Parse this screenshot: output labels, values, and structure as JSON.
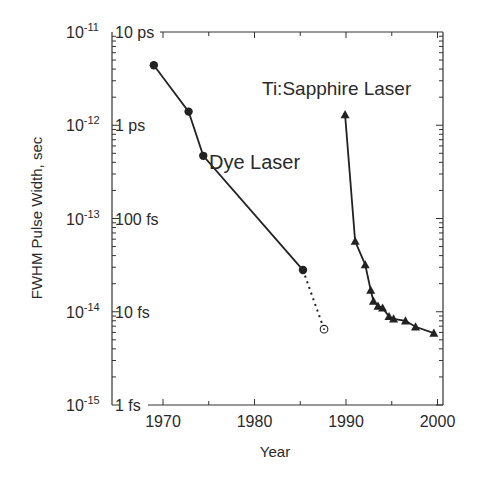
{
  "chart_data": {
    "type": "line",
    "title": "",
    "xlabel": "Year",
    "ylabel": "FWHM Pulse Width, sec",
    "xlim": [
      1965,
      2001
    ],
    "ylim": [
      1e-15,
      1e-11
    ],
    "yscale": "log",
    "x_ticks": [
      1970,
      1980,
      1990,
      2000
    ],
    "x_tick_labels": [
      "1970",
      "1980",
      "1990",
      "2000"
    ],
    "y_ticks": [
      {
        "value": 1e-11,
        "exp_label": "10",
        "exp": "-11",
        "inner_label": "10 ps"
      },
      {
        "value": 1e-12,
        "exp_label": "10",
        "exp": "-12",
        "inner_label": "1 ps"
      },
      {
        "value": 1e-13,
        "exp_label": "10",
        "exp": "-13",
        "inner_label": "100 fs"
      },
      {
        "value": 1e-14,
        "exp_label": "10",
        "exp": "-14",
        "inner_label": "10 fs"
      },
      {
        "value": 1e-15,
        "exp_label": "10",
        "exp": "-15",
        "inner_label": "1 fs"
      }
    ],
    "grid": false,
    "series": [
      {
        "name": "Dye Laser",
        "marker": "filled-circle",
        "line": "solid",
        "x": [
          1969.0,
          1972.8,
          1974.4,
          1985.3
        ],
        "y": [
          4.4e-12,
          1.4e-12,
          4.7e-13,
          2.8e-14
        ]
      },
      {
        "name": "Dye Laser (extension)",
        "marker": "open-circle",
        "line": "dotted",
        "x": [
          1985.3,
          1987.6
        ],
        "y": [
          2.8e-14,
          6.5e-15
        ]
      },
      {
        "name": "Ti:Sapphire Laser",
        "marker": "filled-triangle",
        "line": "solid",
        "x": [
          1989.9,
          1991.0,
          1992.1,
          1992.7,
          1993.0,
          1993.5,
          1994.0,
          1994.7,
          1995.2,
          1996.5,
          1997.6,
          1999.6
        ],
        "y": [
          1.3e-12,
          5.7e-14,
          3.2e-14,
          1.7e-14,
          1.3e-14,
          1.15e-14,
          1.1e-14,
          8.9e-15,
          8.4e-15,
          8e-15,
          6.9e-15,
          5.9e-15
        ]
      }
    ],
    "annotations": [
      {
        "text": "Dye Laser",
        "series": "Dye Laser"
      },
      {
        "text": "Ti:Sapphire Laser",
        "series": "Ti:Sapphire Laser"
      }
    ]
  }
}
